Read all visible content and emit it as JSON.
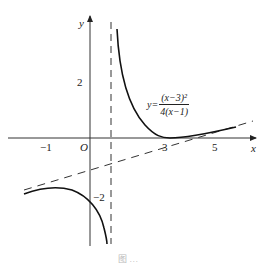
{
  "figure": {
    "axes": {
      "x_label": "x",
      "y_label": "y",
      "origin_label": "O",
      "x_ticks": [
        "−1",
        "3",
        "5"
      ],
      "y_ticks": [
        "2",
        "−2"
      ]
    },
    "function": {
      "lhs": "y=",
      "numerator": "(x−3)²",
      "denominator": "4(x−1)"
    },
    "asymptotes": {
      "vertical": "x = 1",
      "oblique": "dashed line"
    },
    "caption": "图 …"
  }
}
